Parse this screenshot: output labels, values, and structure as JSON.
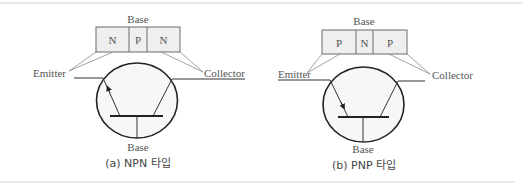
{
  "figure": {
    "npn": {
      "base_top_label": "Base",
      "layers": [
        "N",
        "P",
        "N"
      ],
      "emitter_label": "Emitter",
      "collector_label": "Collector",
      "base_bottom_label": "Base",
      "caption": "(a) NPN 타입",
      "arrow_direction": "outward"
    },
    "pnp": {
      "base_top_label": "Base",
      "layers": [
        "P",
        "N",
        "P"
      ],
      "emitter_label": "Emitter",
      "collector_label": "Collector",
      "base_bottom_label": "Base",
      "caption": "(b) PNP 타입",
      "arrow_direction": "inward"
    },
    "colors": {
      "layer_fill": "#efefef",
      "circle_fill": "#f7f7f7",
      "rule": "#d4d4d4"
    }
  }
}
